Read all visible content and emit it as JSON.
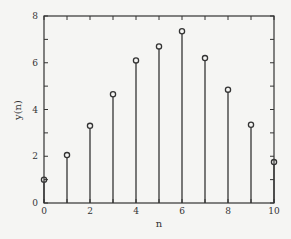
{
  "chart_data": {
    "type": "stem",
    "title": "",
    "xlabel": "n",
    "ylabel": "y(n)",
    "xlim": [
      0,
      10
    ],
    "ylim": [
      0,
      8
    ],
    "xticks": [
      0,
      2,
      4,
      6,
      8,
      10
    ],
    "yticks": [
      0,
      2,
      4,
      6,
      8
    ],
    "grid": false,
    "legend": null,
    "x": [
      0,
      1,
      2,
      3,
      4,
      5,
      6,
      7,
      8,
      9,
      10
    ],
    "values": [
      1.0,
      2.05,
      3.3,
      4.65,
      6.1,
      6.7,
      7.35,
      6.2,
      4.85,
      3.35,
      1.75
    ]
  },
  "colors": {
    "background": "#f5f5f3",
    "axis": "#333333",
    "stem": "#333333"
  }
}
